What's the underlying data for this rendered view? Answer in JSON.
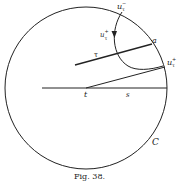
{
  "figure": {
    "caption": "Fig. 38.",
    "colors": {
      "ink": "#222222",
      "background": "#ffffff"
    }
  },
  "labels": {
    "u_minus": {
      "base": "u",
      "sub": "τ",
      "sup": "−"
    },
    "u_plus_arc": {
      "base": "u",
      "sub": "τ",
      "sup": "+"
    },
    "u_plus_circle": {
      "base": "u",
      "sub": "τ",
      "sup": "+"
    },
    "a": "a",
    "tau": "τ",
    "t": "t",
    "s": "s",
    "C": "C"
  }
}
